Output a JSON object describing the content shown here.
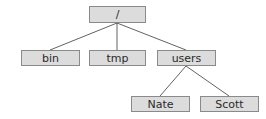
{
  "diagram": {
    "type": "tree",
    "colors": {
      "node_fill": "#dcdcdc",
      "node_border": "#8a8a8a",
      "edge": "#3a3a3a",
      "text": "#2a2a2a"
    },
    "nodes": [
      {
        "id": "root",
        "label": "/"
      },
      {
        "id": "bin",
        "label": "bin"
      },
      {
        "id": "tmp",
        "label": "tmp"
      },
      {
        "id": "users",
        "label": "users"
      },
      {
        "id": "nate",
        "label": "Nate"
      },
      {
        "id": "scott",
        "label": "Scott"
      }
    ],
    "edges": [
      [
        "root",
        "bin"
      ],
      [
        "root",
        "tmp"
      ],
      [
        "root",
        "users"
      ],
      [
        "users",
        "nate"
      ],
      [
        "users",
        "scott"
      ]
    ]
  }
}
